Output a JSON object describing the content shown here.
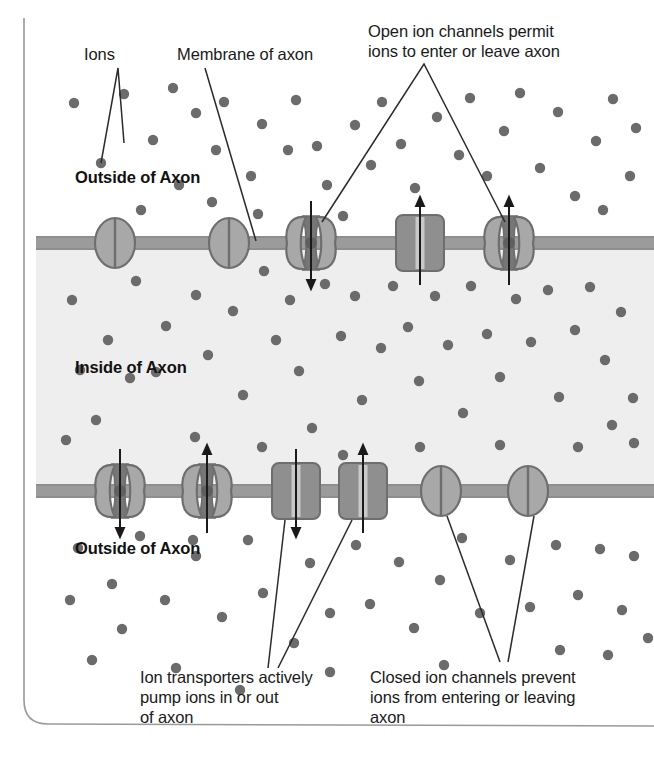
{
  "figure": {
    "background_color": "#ffffff",
    "border_color": "#9a9a9a"
  },
  "colors": {
    "ion_dot": "#6b6b6b",
    "membrane": "#9b9b9b",
    "membrane_edge": "#8a8a8a",
    "inside_fill": "#eeeeee",
    "outside_fill": "#ffffff",
    "channel_fill": "#a8a8a8",
    "channel_stroke": "#6e6e6e",
    "channel_pore": "#767676",
    "transporter_fill": "#8f8f8f",
    "transporter_stroke": "#6e6e6e",
    "transporter_slot": "#c9c9c9",
    "leader_line": "#2b2b2b",
    "arrow": "#1a1a1a",
    "text": "#1a1a1a"
  },
  "labels": {
    "ions": "Ions",
    "membrane_of_axon": "Membrane of axon",
    "open_channels": "Open ion channels permit\nions to enter or leave axon",
    "transporters": "Ion transporters actively\npump ions in or out\nof axon",
    "closed_channels": "Closed ion channels prevent\nions from entering or leaving\naxon",
    "outside_top": "Outside of Axon",
    "inside": "Inside of Axon",
    "outside_bottom": "Outside of Axon"
  },
  "structures": {
    "upper_membrane_y": 243,
    "lower_membrane_y": 491,
    "upper_membrane": [
      {
        "kind": "closed-channel",
        "x": 115,
        "arrow": "none"
      },
      {
        "kind": "closed-channel",
        "x": 229,
        "arrow": "none"
      },
      {
        "kind": "open-channel",
        "x": 311,
        "arrow": "down"
      },
      {
        "kind": "transporter",
        "x": 420,
        "arrow": "up"
      },
      {
        "kind": "open-channel",
        "x": 509,
        "arrow": "up"
      }
    ],
    "lower_membrane": [
      {
        "kind": "open-channel",
        "x": 120,
        "arrow": "down"
      },
      {
        "kind": "open-channel",
        "x": 207,
        "arrow": "up"
      },
      {
        "kind": "transporter",
        "x": 296,
        "arrow": "down"
      },
      {
        "kind": "transporter",
        "x": 363,
        "arrow": "up"
      },
      {
        "kind": "closed-channel",
        "x": 441,
        "arrow": "none"
      },
      {
        "kind": "closed-channel",
        "x": 528,
        "arrow": "none"
      }
    ]
  },
  "ions": {
    "outside_top": [
      [
        74,
        103
      ],
      [
        124,
        94
      ],
      [
        153,
        140
      ],
      [
        173,
        88
      ],
      [
        179,
        185
      ],
      [
        196,
        113
      ],
      [
        216,
        150
      ],
      [
        224,
        102
      ],
      [
        212,
        202
      ],
      [
        251,
        176
      ],
      [
        262,
        124
      ],
      [
        288,
        150
      ],
      [
        296,
        100
      ],
      [
        317,
        146
      ],
      [
        327,
        185
      ],
      [
        355,
        125
      ],
      [
        371,
        165
      ],
      [
        382,
        102
      ],
      [
        401,
        144
      ],
      [
        415,
        188
      ],
      [
        437,
        117
      ],
      [
        459,
        155
      ],
      [
        470,
        98
      ],
      [
        487,
        176
      ],
      [
        504,
        131
      ],
      [
        520,
        93
      ],
      [
        540,
        168
      ],
      [
        558,
        112
      ],
      [
        575,
        196
      ],
      [
        596,
        141
      ],
      [
        613,
        99
      ],
      [
        630,
        176
      ],
      [
        101,
        163
      ],
      [
        141,
        210
      ],
      [
        258,
        214
      ],
      [
        343,
        216
      ],
      [
        603,
        210
      ],
      [
        636,
        128
      ]
    ],
    "inside": [
      [
        72,
        300
      ],
      [
        108,
        340
      ],
      [
        136,
        281
      ],
      [
        166,
        326
      ],
      [
        156,
        372
      ],
      [
        196,
        295
      ],
      [
        208,
        355
      ],
      [
        233,
        311
      ],
      [
        243,
        395
      ],
      [
        264,
        271
      ],
      [
        276,
        340
      ],
      [
        290,
        300
      ],
      [
        299,
        371
      ],
      [
        312,
        428
      ],
      [
        325,
        284
      ],
      [
        341,
        336
      ],
      [
        355,
        296
      ],
      [
        362,
        400
      ],
      [
        381,
        348
      ],
      [
        393,
        286
      ],
      [
        408,
        327
      ],
      [
        419,
        381
      ],
      [
        435,
        296
      ],
      [
        448,
        345
      ],
      [
        463,
        413
      ],
      [
        471,
        286
      ],
      [
        487,
        334
      ],
      [
        500,
        377
      ],
      [
        516,
        299
      ],
      [
        531,
        342
      ],
      [
        548,
        290
      ],
      [
        559,
        397
      ],
      [
        575,
        330
      ],
      [
        590,
        287
      ],
      [
        605,
        360
      ],
      [
        621,
        312
      ],
      [
        633,
        398
      ],
      [
        96,
        420
      ],
      [
        130,
        378
      ],
      [
        195,
        437
      ],
      [
        262,
        447
      ],
      [
        343,
        455
      ],
      [
        420,
        447
      ],
      [
        500,
        445
      ],
      [
        578,
        447
      ],
      [
        634,
        443
      ],
      [
        80,
        370
      ],
      [
        66,
        440
      ],
      [
        612,
        425
      ]
    ],
    "outside_bottom": [
      [
        78,
        548
      ],
      [
        112,
        584
      ],
      [
        140,
        536
      ],
      [
        165,
        600
      ],
      [
        122,
        629
      ],
      [
        92,
        660
      ],
      [
        196,
        556
      ],
      [
        222,
        617
      ],
      [
        176,
        668
      ],
      [
        248,
        540
      ],
      [
        263,
        593
      ],
      [
        294,
        643
      ],
      [
        240,
        690
      ],
      [
        310,
        563
      ],
      [
        330,
        613
      ],
      [
        356,
        545
      ],
      [
        370,
        604
      ],
      [
        330,
        672
      ],
      [
        399,
        562
      ],
      [
        414,
        628
      ],
      [
        440,
        580
      ],
      [
        462,
        538
      ],
      [
        480,
        613
      ],
      [
        444,
        665
      ],
      [
        510,
        560
      ],
      [
        530,
        607
      ],
      [
        556,
        545
      ],
      [
        578,
        595
      ],
      [
        600,
        549
      ],
      [
        622,
        610
      ],
      [
        634,
        556
      ],
      [
        560,
        650
      ],
      [
        608,
        655
      ],
      [
        193,
        540
      ],
      [
        70,
        600
      ],
      [
        648,
        638
      ]
    ]
  }
}
